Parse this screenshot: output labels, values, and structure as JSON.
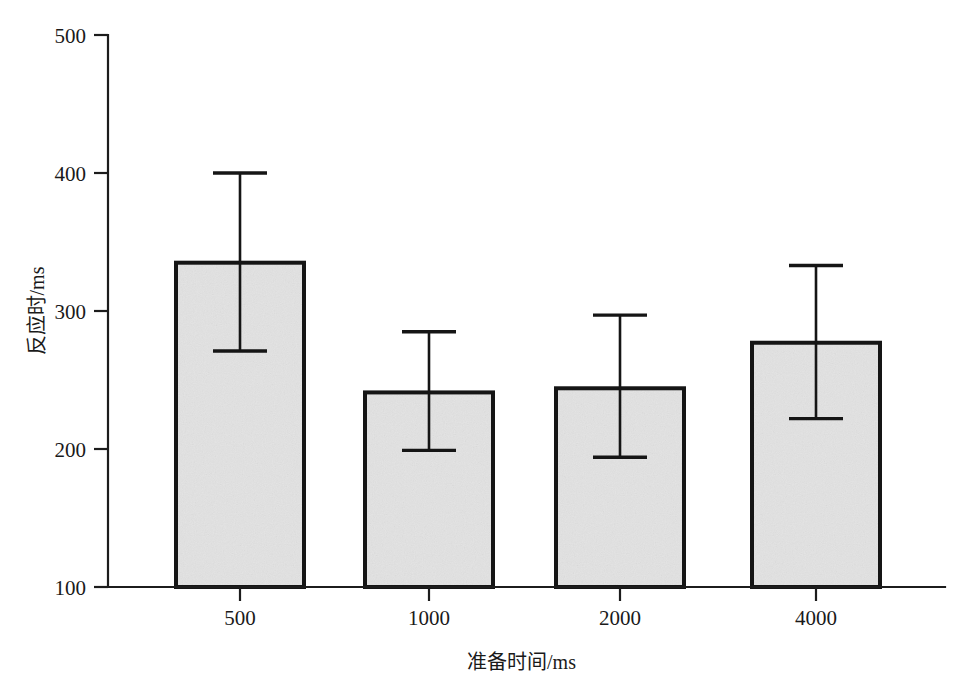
{
  "chart_data": {
    "type": "bar",
    "title": "",
    "subtitle": "",
    "xlabel": "准备时间/ms",
    "ylabel": "反应时/ms",
    "categories": [
      "500",
      "1000",
      "2000",
      "4000"
    ],
    "values": [
      335,
      241,
      244,
      277
    ],
    "error_upper": [
      400,
      285,
      297,
      333
    ],
    "error_lower": [
      271,
      199,
      194,
      222
    ],
    "series": [
      {
        "name": "反应时",
        "values": [
          335,
          241,
          244,
          277
        ]
      }
    ],
    "ylim": [
      100,
      500
    ],
    "yticks": [
      100,
      200,
      300,
      400,
      500
    ],
    "ytick_labels": [
      "100",
      "200",
      "300",
      "400",
      "500"
    ],
    "xtick_labels": [
      "500",
      "1000",
      "2000",
      "4000"
    ],
    "grid": false,
    "legend": false,
    "legend_position": "none",
    "error_bar_style": "capped-range",
    "annotations": []
  },
  "style": {
    "bar_fill": "#e3e3e3",
    "bar_edge": "#151515",
    "axis_color": "#1c1c1c",
    "text_color": "#1a1a1a",
    "background": "#ffffff"
  },
  "geometry": {
    "plot_left": 108,
    "plot_right": 945,
    "plot_top": 35,
    "plot_bottom": 587,
    "y_value_top": 500,
    "y_value_bottom": 100,
    "bars": [
      {
        "x_left": 176,
        "x_right": 304,
        "center": 240
      },
      {
        "x_left": 365,
        "x_right": 493,
        "center": 429
      },
      {
        "x_left": 556,
        "x_right": 684,
        "center": 620
      },
      {
        "x_left": 752,
        "x_right": 880,
        "center": 816
      }
    ],
    "cap_half_width": 27
  }
}
